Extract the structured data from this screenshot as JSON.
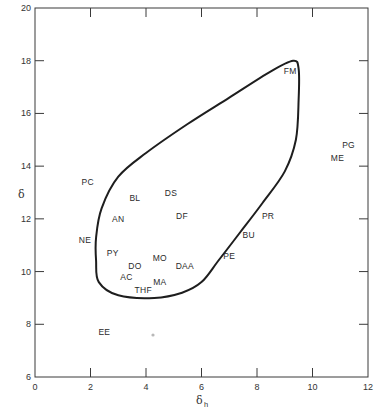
{
  "chart_data": {
    "type": "scatter",
    "title": "",
    "xlabel": "δh",
    "ylabel": "δ",
    "xlim": [
      0,
      12
    ],
    "ylim": [
      6,
      20
    ],
    "x_ticks": [
      0,
      2,
      4,
      6,
      8,
      10,
      12
    ],
    "y_ticks": [
      6,
      8,
      10,
      12,
      14,
      16,
      18,
      20
    ],
    "grid": false,
    "legend": null,
    "annotations": "Closed solubility-region boundary curve enclosing most solvent labels, apex near FM (≈9.3, 18)",
    "points": [
      {
        "label": "FM",
        "x": 9.2,
        "y": 17.6
      },
      {
        "label": "PG",
        "x": 11.3,
        "y": 14.8
      },
      {
        "label": "ME",
        "x": 10.9,
        "y": 14.3
      },
      {
        "label": "PC",
        "x": 1.9,
        "y": 13.4
      },
      {
        "label": "BL",
        "x": 3.6,
        "y": 12.8
      },
      {
        "label": "DS",
        "x": 4.9,
        "y": 13.0
      },
      {
        "label": "AN",
        "x": 3.0,
        "y": 12.0
      },
      {
        "label": "DF",
        "x": 5.3,
        "y": 12.1
      },
      {
        "label": "PR",
        "x": 8.4,
        "y": 12.1
      },
      {
        "label": "NE",
        "x": 1.8,
        "y": 11.2
      },
      {
        "label": "BU",
        "x": 7.7,
        "y": 11.4
      },
      {
        "label": "PY",
        "x": 2.8,
        "y": 10.7
      },
      {
        "label": "MO",
        "x": 4.5,
        "y": 10.5
      },
      {
        "label": "PE",
        "x": 7.0,
        "y": 10.6
      },
      {
        "label": "DO",
        "x": 3.6,
        "y": 10.2
      },
      {
        "label": "DAA",
        "x": 5.4,
        "y": 10.2
      },
      {
        "label": "AC",
        "x": 3.3,
        "y": 9.8
      },
      {
        "label": "MA",
        "x": 4.5,
        "y": 9.6
      },
      {
        "label": "THF",
        "x": 3.9,
        "y": 9.3
      },
      {
        "label": "EE",
        "x": 2.5,
        "y": 7.7
      }
    ],
    "boundary_curve": [
      [
        9.3,
        18.0
      ],
      [
        9.5,
        17.7
      ],
      [
        9.5,
        16.5
      ],
      [
        9.4,
        15.0
      ],
      [
        9.0,
        13.8
      ],
      [
        8.2,
        12.6
      ],
      [
        7.4,
        11.5
      ],
      [
        6.6,
        10.4
      ],
      [
        6.0,
        9.6
      ],
      [
        5.3,
        9.2
      ],
      [
        4.3,
        9.0
      ],
      [
        3.0,
        9.1
      ],
      [
        2.3,
        9.6
      ],
      [
        2.2,
        10.4
      ],
      [
        2.2,
        11.3
      ],
      [
        2.4,
        12.4
      ],
      [
        3.0,
        13.6
      ],
      [
        4.0,
        14.5
      ],
      [
        5.5,
        15.6
      ],
      [
        7.0,
        16.6
      ],
      [
        8.5,
        17.6
      ],
      [
        9.3,
        18.0
      ]
    ]
  },
  "axes": {
    "x_title_main": "δ",
    "x_title_sub": "h",
    "y_title": "δ",
    "x_tick_labels": [
      "0",
      "2",
      "4",
      "6",
      "8",
      "10",
      "12"
    ],
    "y_tick_labels": [
      "6",
      "8",
      "10",
      "12",
      "14",
      "16",
      "18",
      "20"
    ]
  }
}
